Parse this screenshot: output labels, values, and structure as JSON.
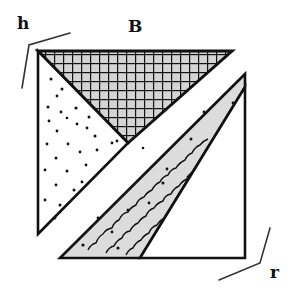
{
  "diagram": {
    "type": "square-dissection",
    "labels": {
      "h": "h",
      "B": "B",
      "r": "r"
    },
    "regions": [
      {
        "name": "top-triangle",
        "fill": "crosshatch",
        "color": "#111111",
        "background": "#d8d8d8"
      },
      {
        "name": "left-triangle",
        "fill": "dots",
        "color": "#111111",
        "background": "#ffffff"
      },
      {
        "name": "diagonal-band",
        "fill": "wavy-lines-dots",
        "color": "#111111",
        "background": "#dcdcdc"
      },
      {
        "name": "bottom-right-triangle",
        "fill": "none",
        "color": "#111111",
        "background": "#ffffff"
      }
    ],
    "colors": {
      "stroke": "#111111",
      "band_fill": "#dcdcdc",
      "hatch_fill": "#d4d4d4"
    }
  }
}
